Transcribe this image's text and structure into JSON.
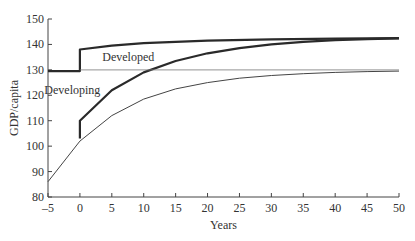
{
  "chart_data": {
    "type": "line",
    "title": "",
    "xlabel": "Years",
    "ylabel": "GDP/capita",
    "xlim": [
      -5,
      50
    ],
    "ylim": [
      80,
      150
    ],
    "x_ticks": [
      -5,
      0,
      5,
      10,
      15,
      20,
      25,
      30,
      35,
      40,
      45,
      50
    ],
    "y_ticks": [
      80,
      90,
      100,
      110,
      120,
      130,
      140,
      150
    ],
    "grid": false,
    "annotations": [
      {
        "text": "Developed",
        "x": 3.5,
        "y": 135
      },
      {
        "text": "Developing",
        "x": -1.5,
        "y": 122
      }
    ],
    "series": [
      {
        "name": "Developed",
        "style": "thick",
        "x": [
          -5,
          0,
          0,
          5,
          10,
          20,
          30,
          40,
          50
        ],
        "y": [
          129.5,
          129.5,
          138,
          139.5,
          140.5,
          141.5,
          142,
          142.3,
          142.5
        ]
      },
      {
        "name": "Developing (with shock)",
        "style": "thick",
        "x": [
          0,
          0,
          5,
          10,
          15,
          20,
          25,
          30,
          35,
          40,
          45,
          50
        ],
        "y": [
          103,
          110,
          122,
          129,
          133.5,
          136.5,
          138.5,
          140,
          141,
          141.7,
          142.1,
          142.4
        ]
      },
      {
        "name": "Developing (baseline)",
        "style": "thin",
        "x": [
          -5,
          0,
          5,
          10,
          15,
          20,
          25,
          30,
          35,
          40,
          45,
          50
        ],
        "y": [
          86,
          102,
          112,
          118.5,
          122.5,
          125,
          126.7,
          127.8,
          128.5,
          129,
          129.3,
          129.5
        ]
      },
      {
        "name": "Reference 130",
        "style": "hairline",
        "x": [
          0,
          50
        ],
        "y": [
          130,
          130
        ]
      }
    ]
  },
  "labels": {
    "developed": "Developed",
    "developing": "Developing",
    "xlabel": "Years",
    "ylabel": "GDP/capita"
  }
}
